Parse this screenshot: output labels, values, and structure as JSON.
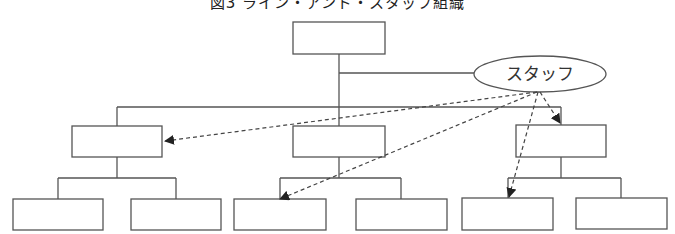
{
  "diagram": {
    "title": "図3 ライン・アンド・スタッフ組織",
    "staff_label": "スタッフ",
    "colors": {
      "line": "#555555",
      "arrow": "#222222",
      "background": "#ffffff"
    },
    "nodes": {
      "top": {
        "x": 293,
        "y": 22,
        "w": 92,
        "h": 32
      },
      "level2": [
        {
          "x": 72,
          "y": 126,
          "w": 90,
          "h": 31
        },
        {
          "x": 293,
          "y": 126,
          "w": 92,
          "h": 31
        },
        {
          "x": 516,
          "y": 125,
          "w": 90,
          "h": 32
        }
      ],
      "level3": [
        {
          "x": 13,
          "y": 199,
          "w": 90,
          "h": 31
        },
        {
          "x": 131,
          "y": 199,
          "w": 90,
          "h": 31
        },
        {
          "x": 234,
          "y": 199,
          "w": 92,
          "h": 31
        },
        {
          "x": 356,
          "y": 199,
          "w": 91,
          "h": 31
        },
        {
          "x": 462,
          "y": 198,
          "w": 91,
          "h": 32
        },
        {
          "x": 576,
          "y": 198,
          "w": 91,
          "h": 31
        }
      ],
      "staff": {
        "cx": 540,
        "cy": 74,
        "rx": 66,
        "ry": 18
      }
    },
    "staff_advice_arrows": [
      {
        "to": "level2-left",
        "x2": 164,
        "y2": 141
      },
      {
        "to": "level2-right",
        "x2": 560,
        "y2": 123
      },
      {
        "to": "level3-center-left",
        "x2": 280,
        "y2": 199
      },
      {
        "to": "level3-right-left",
        "x2": 508,
        "y2": 197
      }
    ]
  }
}
